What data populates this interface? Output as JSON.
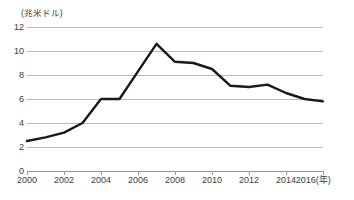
{
  "chart_data": {
    "type": "line",
    "title": "",
    "unit_label": "(兆米ドル)",
    "xlabel": "(年)",
    "ylabel": "",
    "grid": true,
    "legend": null,
    "xlim": [
      2000,
      2016
    ],
    "ylim": [
      0,
      12
    ],
    "ytick_labels": [
      "12",
      "10",
      "8",
      "6",
      "4",
      "2",
      "0"
    ],
    "ytick_values": [
      12,
      10,
      8,
      6,
      4,
      2,
      0
    ],
    "xtick_labels": [
      "2000",
      "2002",
      "2004",
      "2006",
      "2008",
      "2010",
      "2012",
      "2014",
      "2016"
    ],
    "xtick_values": [
      2000,
      2002,
      2004,
      2006,
      2008,
      2010,
      2012,
      2014,
      2016
    ],
    "x": [
      2000,
      2001,
      2002,
      2003,
      2004,
      2005,
      2006,
      2007,
      2008,
      2009,
      2010,
      2011,
      2012,
      2013,
      2014,
      2015,
      2016
    ],
    "values": [
      2.5,
      2.8,
      3.2,
      4.0,
      6.0,
      6.0,
      8.3,
      10.6,
      9.1,
      9.0,
      8.5,
      7.1,
      7.0,
      7.2,
      6.5,
      6.0,
      5.8
    ],
    "series": [
      {
        "name": "series-1",
        "color": "#1a1a1a",
        "values": [
          2.5,
          2.8,
          3.2,
          4.0,
          6.0,
          6.0,
          8.3,
          10.6,
          9.1,
          9.0,
          8.5,
          7.1,
          7.0,
          7.2,
          6.5,
          6.0,
          5.8
        ]
      }
    ]
  },
  "style": {
    "line_color": "#1a1a1a",
    "grid_color": "#b9b9b9",
    "axis_color": "#9a9a9a",
    "text_color": "#3c3c3c",
    "background": "#ffffff"
  }
}
